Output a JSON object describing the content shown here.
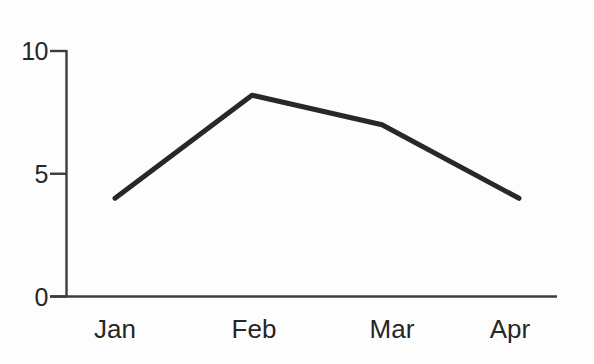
{
  "chart_data": {
    "type": "line",
    "title": "",
    "xlabel": "",
    "ylabel": "",
    "categories": [
      "Jan",
      "Feb",
      "Mar",
      "Apr"
    ],
    "values": [
      4,
      8.2,
      7,
      4
    ],
    "ylim": [
      0,
      10
    ],
    "yticks": [
      0,
      5,
      10
    ],
    "grid": false,
    "legend": "none",
    "colors": {
      "line": "#282828",
      "axis": "#3c3c3c",
      "text": "#262626",
      "background": "#fdfdfd"
    }
  }
}
